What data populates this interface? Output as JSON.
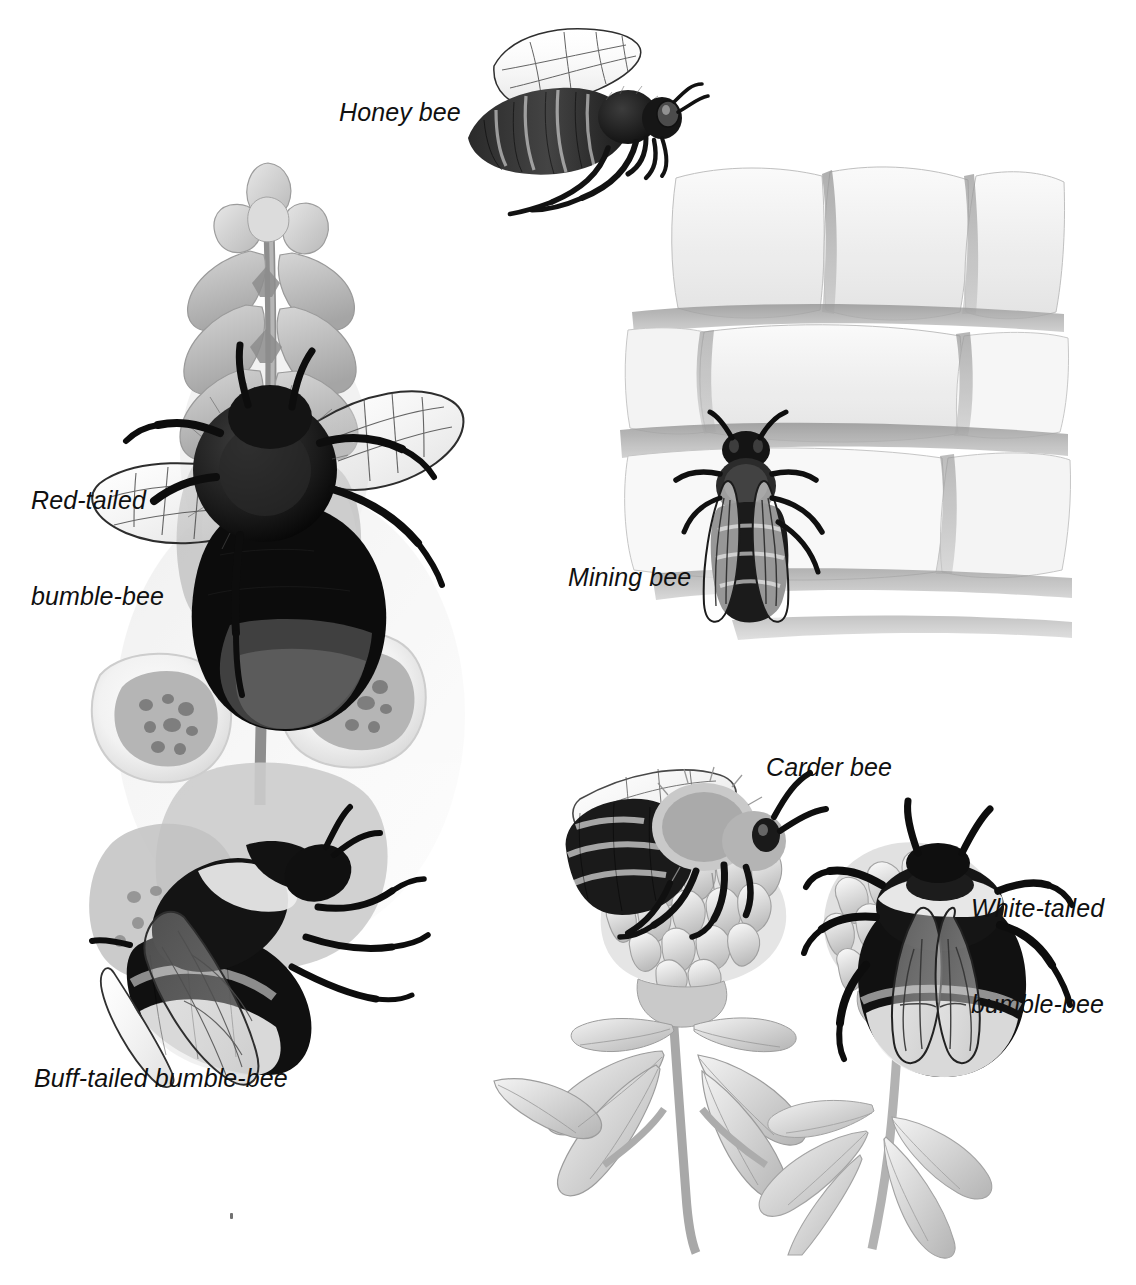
{
  "plate": {
    "title": "Bees illustration plate",
    "background_color": "#ffffff",
    "text_color": "#101010",
    "style": "grayscale pencil and watercolour natural-history illustration",
    "width": 1136,
    "height": 1285
  },
  "labels": [
    {
      "id": "honey-bee",
      "text": "Honey bee",
      "x": 339,
      "y": 96,
      "lines": [
        "Honey bee"
      ]
    },
    {
      "id": "red-tailed-bumble-bee",
      "text": "Red-tailed bumble-bee",
      "x": 31,
      "y": 420,
      "lines": [
        "Red-tailed",
        "bumble-bee"
      ]
    },
    {
      "id": "mining-bee",
      "text": "Mining bee",
      "x": 568,
      "y": 561,
      "lines": [
        "Mining bee"
      ]
    },
    {
      "id": "carder-bee",
      "text": "Carder bee",
      "x": 766,
      "y": 751,
      "lines": [
        "Carder bee"
      ]
    },
    {
      "id": "white-tailed-bumble-bee",
      "text": "White-tailed bumble-bee",
      "x": 971,
      "y": 828,
      "lines": [
        "White-tailed",
        "bumble-bee"
      ]
    },
    {
      "id": "buff-tailed-bumble-bee",
      "text": "Buff-tailed bumble-bee",
      "x": 34,
      "y": 1062,
      "lines": [
        "Buff-tailed bumble-bee"
      ]
    }
  ],
  "figures": [
    {
      "id": "honey-bee-figure",
      "subject": "Honey bee in flight, side view, wings raised",
      "x": 452,
      "y": 24,
      "w": 240,
      "h": 190,
      "elements": [
        "wing",
        "thorax",
        "striped-abdomen",
        "head",
        "antenna",
        "legs"
      ]
    },
    {
      "id": "foxglove-figure",
      "subject": "Foxglove spike with red-tailed bumble-bee above and buff-tailed bumble-bee below",
      "x": 88,
      "y": 160,
      "w": 420,
      "h": 900,
      "elements": [
        "flower-spike",
        "buds",
        "open-bells",
        "spotted-throats",
        "red-tailed-bumble-bee",
        "buff-tailed-bumble-bee"
      ]
    },
    {
      "id": "brick-wall-figure",
      "subject": "Mining bee resting on a stone-brick wall",
      "x": 620,
      "y": 168,
      "w": 440,
      "h": 480,
      "elements": [
        "brick-courses",
        "mortar-lines",
        "mining-bee"
      ]
    },
    {
      "id": "clover-figure",
      "subject": "Red clover flower head and trifoliate leaves with carder bee and white-tailed bumble-bee",
      "x": 490,
      "y": 740,
      "w": 600,
      "h": 500,
      "elements": [
        "clover-head",
        "stem",
        "trifoliate-leaves",
        "carder-bee",
        "white-tailed-bumble-bee"
      ]
    }
  ],
  "marks": [
    {
      "id": "paper-speck",
      "x": 230,
      "y": 1215
    }
  ]
}
